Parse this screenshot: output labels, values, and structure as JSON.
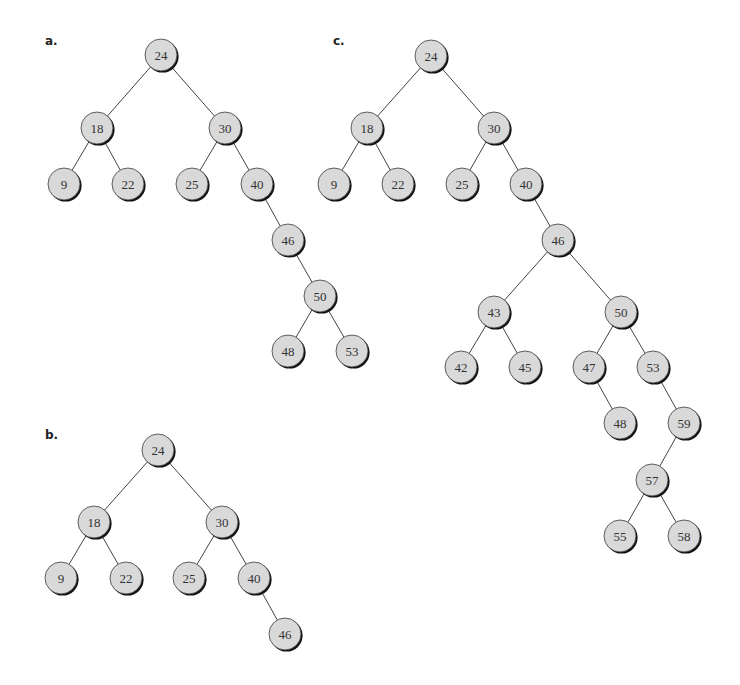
{
  "figure": {
    "panels": [
      {
        "label": "a.",
        "label_pos": [
          45,
          34
        ],
        "nodes": [
          {
            "id": "a24",
            "value": "24",
            "x": 161,
            "y": 55
          },
          {
            "id": "a18",
            "value": "18",
            "x": 97,
            "y": 128
          },
          {
            "id": "a30",
            "value": "30",
            "x": 225,
            "y": 128
          },
          {
            "id": "a9",
            "value": "9",
            "x": 64,
            "y": 184
          },
          {
            "id": "a22",
            "value": "22",
            "x": 128,
            "y": 184
          },
          {
            "id": "a25",
            "value": "25",
            "x": 192,
            "y": 184
          },
          {
            "id": "a40",
            "value": "40",
            "x": 257,
            "y": 184
          },
          {
            "id": "a46",
            "value": "46",
            "x": 288,
            "y": 240
          },
          {
            "id": "a50",
            "value": "50",
            "x": 320,
            "y": 296
          },
          {
            "id": "a48",
            "value": "48",
            "x": 288,
            "y": 351
          },
          {
            "id": "a53",
            "value": "53",
            "x": 352,
            "y": 351
          }
        ],
        "edges": [
          [
            "a24",
            "a18"
          ],
          [
            "a24",
            "a30"
          ],
          [
            "a18",
            "a9"
          ],
          [
            "a18",
            "a22"
          ],
          [
            "a30",
            "a25"
          ],
          [
            "a30",
            "a40"
          ],
          [
            "a40",
            "a46"
          ],
          [
            "a46",
            "a50"
          ],
          [
            "a50",
            "a48"
          ],
          [
            "a50",
            "a53"
          ]
        ]
      },
      {
        "label": "b.",
        "label_pos": [
          45,
          428
        ],
        "nodes": [
          {
            "id": "b24",
            "value": "24",
            "x": 158,
            "y": 450
          },
          {
            "id": "b18",
            "value": "18",
            "x": 94,
            "y": 522
          },
          {
            "id": "b30",
            "value": "30",
            "x": 222,
            "y": 522
          },
          {
            "id": "b9",
            "value": "9",
            "x": 61,
            "y": 578
          },
          {
            "id": "b22",
            "value": "22",
            "x": 126,
            "y": 578
          },
          {
            "id": "b25",
            "value": "25",
            "x": 189,
            "y": 578
          },
          {
            "id": "b40",
            "value": "40",
            "x": 254,
            "y": 578
          },
          {
            "id": "b46",
            "value": "46",
            "x": 285,
            "y": 634
          }
        ],
        "edges": [
          [
            "b24",
            "b18"
          ],
          [
            "b24",
            "b30"
          ],
          [
            "b18",
            "b9"
          ],
          [
            "b18",
            "b22"
          ],
          [
            "b30",
            "b25"
          ],
          [
            "b30",
            "b40"
          ],
          [
            "b40",
            "b46"
          ]
        ]
      },
      {
        "label": "c.",
        "label_pos": [
          333,
          34
        ],
        "nodes": [
          {
            "id": "c24",
            "value": "24",
            "x": 431,
            "y": 56
          },
          {
            "id": "c18",
            "value": "18",
            "x": 367,
            "y": 128
          },
          {
            "id": "c30",
            "value": "30",
            "x": 494,
            "y": 128
          },
          {
            "id": "c9",
            "value": "9",
            "x": 334,
            "y": 184
          },
          {
            "id": "c22",
            "value": "22",
            "x": 398,
            "y": 184
          },
          {
            "id": "c25",
            "value": "25",
            "x": 462,
            "y": 184
          },
          {
            "id": "c40",
            "value": "40",
            "x": 526,
            "y": 184
          },
          {
            "id": "c46",
            "value": "46",
            "x": 558,
            "y": 240
          },
          {
            "id": "c43",
            "value": "43",
            "x": 494,
            "y": 312
          },
          {
            "id": "c50",
            "value": "50",
            "x": 621,
            "y": 312
          },
          {
            "id": "c42",
            "value": "42",
            "x": 461,
            "y": 367
          },
          {
            "id": "c45",
            "value": "45",
            "x": 525,
            "y": 367
          },
          {
            "id": "c47",
            "value": "47",
            "x": 589,
            "y": 367
          },
          {
            "id": "c53",
            "value": "53",
            "x": 653,
            "y": 367
          },
          {
            "id": "c48",
            "value": "48",
            "x": 620,
            "y": 423
          },
          {
            "id": "c59",
            "value": "59",
            "x": 684,
            "y": 423
          },
          {
            "id": "c57",
            "value": "57",
            "x": 652,
            "y": 480
          },
          {
            "id": "c55",
            "value": "55",
            "x": 620,
            "y": 536
          },
          {
            "id": "c58",
            "value": "58",
            "x": 684,
            "y": 536
          }
        ],
        "edges": [
          [
            "c24",
            "c18"
          ],
          [
            "c24",
            "c30"
          ],
          [
            "c18",
            "c9"
          ],
          [
            "c18",
            "c22"
          ],
          [
            "c30",
            "c25"
          ],
          [
            "c30",
            "c40"
          ],
          [
            "c40",
            "c46"
          ],
          [
            "c46",
            "c43"
          ],
          [
            "c46",
            "c50"
          ],
          [
            "c43",
            "c42"
          ],
          [
            "c43",
            "c45"
          ],
          [
            "c50",
            "c47"
          ],
          [
            "c50",
            "c53"
          ],
          [
            "c47",
            "c48"
          ],
          [
            "c53",
            "c59"
          ],
          [
            "c59",
            "c57"
          ],
          [
            "c57",
            "c55"
          ],
          [
            "c57",
            "c58"
          ]
        ]
      }
    ],
    "style": {
      "node_radius": 16,
      "node_fill": "#d9d9d9",
      "node_stroke": "#3a3a3a",
      "shadow_color": "#111111",
      "edge_color": "#444444"
    }
  }
}
